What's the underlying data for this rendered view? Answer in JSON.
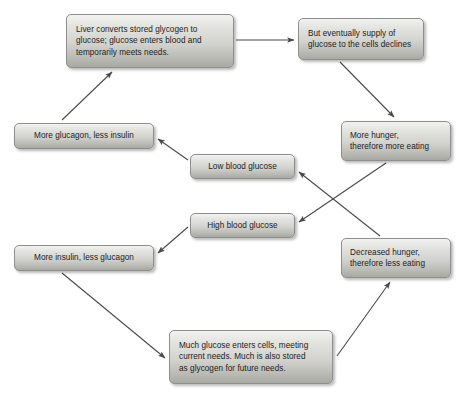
{
  "diagram": {
    "background_color": "#ffffff",
    "box_border_color": "#8e8e8e",
    "box_fill_top_color": "#f2f2f0",
    "box_fill_bottom_color": "#a9a9a4",
    "arrow_color": "#4a4a4a",
    "text_color": "#1c1c1c",
    "nodes": [
      {
        "id": "liver-converts",
        "label": "Liver converts stored glycogen to\nglucose; glucose enters blood and\ntemporarily meets needs.",
        "x": 66,
        "y": 14,
        "w": 168,
        "h": 54
      },
      {
        "id": "supply-declines",
        "label": "But eventually supply of\nglucose to the cells declines",
        "x": 298,
        "y": 18,
        "w": 126,
        "h": 42
      },
      {
        "id": "more-glucagon",
        "label": "More glucagon, less insulin",
        "x": 14,
        "y": 123,
        "w": 140,
        "h": 26
      },
      {
        "id": "more-hunger",
        "label": "More hunger,\ntherefore more eating",
        "x": 341,
        "y": 121,
        "w": 110,
        "h": 40
      },
      {
        "id": "low-blood-glucose",
        "label": "Low blood glucose",
        "x": 190,
        "y": 154,
        "w": 105,
        "h": 25
      },
      {
        "id": "high-blood-glucose",
        "label": "High blood glucose",
        "x": 190,
        "y": 213,
        "w": 105,
        "h": 25
      },
      {
        "id": "more-insulin",
        "label": "More insulin, less glucagon",
        "x": 14,
        "y": 245,
        "w": 140,
        "h": 26
      },
      {
        "id": "decreased-hunger",
        "label": "Decreased hunger,\ntherefore less eating",
        "x": 341,
        "y": 238,
        "w": 110,
        "h": 40
      },
      {
        "id": "much-glucose",
        "label": "Much glucose enters cells, meeting\ncurrent needs. Much is also stored\nas glycogen for future needs.",
        "x": 169,
        "y": 330,
        "w": 164,
        "h": 54
      }
    ],
    "edges": [
      {
        "id": "liver-to-supply",
        "from": "liver-converts",
        "to": "supply-declines",
        "x1": 236,
        "y1": 40,
        "x2": 294,
        "y2": 40
      },
      {
        "id": "supply-to-more-hunger",
        "from": "supply-declines",
        "to": "more-hunger",
        "x1": 340,
        "y1": 62,
        "x2": 394,
        "y2": 117
      },
      {
        "id": "more-hunger-to-high-glucose",
        "from": "more-hunger",
        "to": "high-blood-glucose",
        "x1": 386,
        "y1": 163,
        "x2": 299,
        "y2": 222
      },
      {
        "id": "high-glucose-to-more-insulin",
        "from": "high-blood-glucose",
        "to": "more-insulin",
        "x1": 188,
        "y1": 227,
        "x2": 158,
        "y2": 253
      },
      {
        "id": "more-insulin-to-much-glucose",
        "from": "more-insulin",
        "to": "much-glucose",
        "x1": 62,
        "y1": 273,
        "x2": 165,
        "y2": 358
      },
      {
        "id": "much-glucose-to-decreased-hunger",
        "from": "much-glucose",
        "to": "decreased-hunger",
        "x1": 337,
        "y1": 356,
        "x2": 390,
        "y2": 282
      },
      {
        "id": "decreased-hunger-to-low-glucose",
        "from": "decreased-hunger",
        "to": "low-blood-glucose",
        "x1": 380,
        "y1": 236,
        "x2": 299,
        "y2": 172
      },
      {
        "id": "low-glucose-to-more-glucagon",
        "from": "low-blood-glucose",
        "to": "more-glucagon",
        "x1": 188,
        "y1": 160,
        "x2": 158,
        "y2": 139
      },
      {
        "id": "more-glucagon-to-liver",
        "from": "more-glucagon",
        "to": "liver-converts",
        "x1": 62,
        "y1": 120,
        "x2": 112,
        "y2": 72
      }
    ]
  }
}
